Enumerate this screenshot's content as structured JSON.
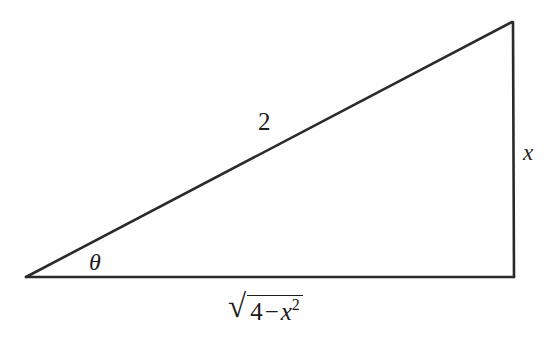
{
  "figure": {
    "type": "right-triangle-trig-substitution",
    "background_color": "#fefefe",
    "stroke_color": "#2a2a2a",
    "stroke_width_px": 2.4,
    "geometry": {
      "vertices": {
        "left_apex": [
          26,
          277
        ],
        "top_right": [
          512,
          22
        ],
        "bottom_right": [
          514,
          277
        ]
      },
      "sides": {
        "hypotenuse": {
          "from": "left_apex",
          "to": "top_right",
          "label_ref": "labels.hypotenuse"
        },
        "vertical_leg": {
          "from": "top_right",
          "to": "bottom_right",
          "label_ref": "labels.vertical_leg"
        },
        "base_leg": {
          "from": "bottom_right",
          "to": "left_apex",
          "label_ref": "labels.base_leg"
        }
      },
      "right_angle_at": "bottom_right",
      "marked_angle_at": "left_apex"
    }
  },
  "labels": {
    "hypotenuse": "2",
    "vertical_leg": "x",
    "angle": "θ",
    "base_leg": {
      "radical_sign": "√",
      "radicand_number": "4",
      "radicand_operator": "−",
      "radicand_variable": "x",
      "radicand_exponent": "2",
      "plain_text": "√(4 − x²)"
    }
  }
}
